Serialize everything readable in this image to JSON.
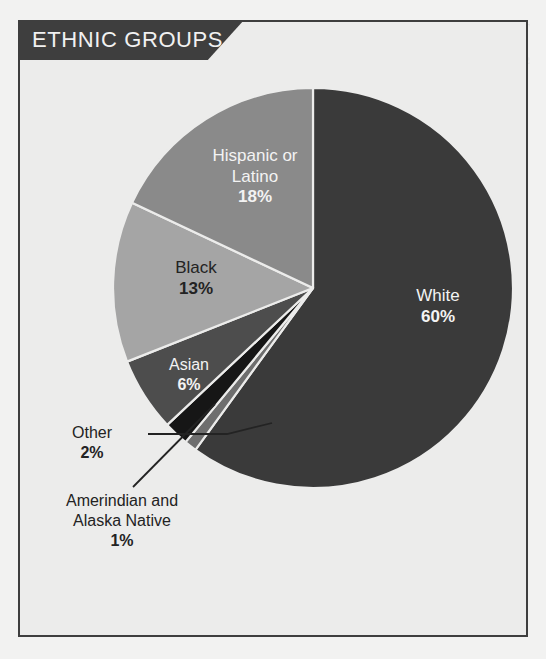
{
  "panel": {
    "title": "ETHNIC GROUPS",
    "border_color": "#3e3e3e",
    "background_color": "#ececeb",
    "banner_color": "#3e3e3e",
    "banner_text_color": "#f1f1f1"
  },
  "chart_data": {
    "type": "pie",
    "title": "ETHNIC GROUPS",
    "unit": "%",
    "start_angle_deg": 0,
    "direction": "clockwise",
    "categories": [
      "White",
      "Amerindian and Alaska Native",
      "Other",
      "Asian",
      "Black",
      "Hispanic or Latino"
    ],
    "values": [
      60,
      1,
      2,
      6,
      13,
      18
    ],
    "labels": [
      "60%",
      "1%",
      "2%",
      "6%",
      "13%",
      "18%"
    ],
    "colors": [
      "#3a3a3a",
      "#6e6e6e",
      "#161616",
      "#4d4d4d",
      "#a5a5a5",
      "#8a8a8a"
    ],
    "separator_color": "#ececeb",
    "legend": "none",
    "grid": false,
    "slices": [
      {
        "name": "White",
        "value": 60,
        "label": "60%",
        "color": "#3a3a3a",
        "label_placement": "inside",
        "label_color": "#f3f3f3"
      },
      {
        "name": "Amerindian and Alaska Native",
        "value": 1,
        "label": "1%",
        "color": "#6e6e6e",
        "label_placement": "callout",
        "label_color": "#232323"
      },
      {
        "name": "Other",
        "value": 2,
        "label": "2%",
        "color": "#161616",
        "label_placement": "callout",
        "label_color": "#232323"
      },
      {
        "name": "Asian",
        "value": 6,
        "label": "6%",
        "color": "#4d4d4d",
        "label_placement": "inside",
        "label_color": "#f3f3f3"
      },
      {
        "name": "Black",
        "value": 13,
        "label": "13%",
        "color": "#a5a5a5",
        "label_placement": "inside",
        "label_color": "#232323"
      },
      {
        "name": "Hispanic or Latino",
        "value": 18,
        "label": "18%",
        "color": "#8a8a8a",
        "label_placement": "inside",
        "label_color": "#f3f3f3"
      }
    ]
  },
  "labels": {
    "white": {
      "line1": "White",
      "pct": "60%"
    },
    "hispanic": {
      "line1": "Hispanic or",
      "line2": "Latino",
      "pct": "18%"
    },
    "black": {
      "line1": "Black",
      "pct": "13%"
    },
    "asian": {
      "line1": "Asian",
      "pct": "6%"
    },
    "other": {
      "line1": "Other",
      "pct": "2%"
    },
    "amerindian": {
      "line1": "Amerindian and",
      "line2": "Alaska Native",
      "pct": "1%"
    }
  },
  "ghost_text": "THE UNITED  ancient range of the  population across  the regions of  world sections and  divided figures  continue below the  line of the table"
}
